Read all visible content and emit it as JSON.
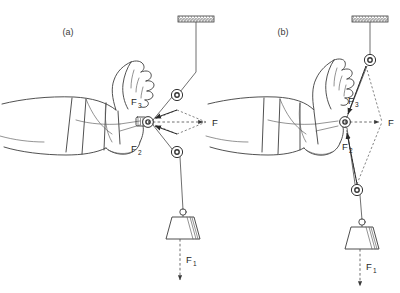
{
  "figure": {
    "background_color": "#ffffff",
    "line_color": "#3a3a3a",
    "width": 400,
    "height": 293
  },
  "panels": [
    {
      "id": "a",
      "label": "(a)",
      "label_x": 68,
      "label_y": 35,
      "description": "Wide-angle traction: pulleys spaced apart, resultant F horizontal",
      "ceiling": {
        "x": 178,
        "y": 16,
        "width": 36,
        "height": 6
      },
      "attachment": {
        "x": 148,
        "y": 122
      },
      "resultant": {
        "label": "F",
        "label_x": 214,
        "label_y": 125,
        "tip_x": 206,
        "tip_y": 122
      },
      "pulleys": [
        {
          "name": "upper-pulley",
          "cx": 177,
          "cy": 95,
          "r": 5.6
        },
        {
          "name": "lower-pulley",
          "cx": 177,
          "cy": 152,
          "r": 5.6
        }
      ],
      "vectors": [
        {
          "label": "F",
          "subscript": "3",
          "label_x": 131,
          "label_y": 104,
          "from_x": 177,
          "from_y": 100,
          "to_x": 152,
          "to_y": 110
        },
        {
          "label": "F",
          "subscript": "2",
          "label_x": 131,
          "label_y": 151,
          "from_x": 177,
          "from_y": 146,
          "to_x": 152,
          "to_y": 136
        }
      ],
      "weight": {
        "cx": 177,
        "cy": 228,
        "top_w": 22,
        "bottom_w": 34,
        "height": 22
      },
      "weight_force": {
        "label": "F",
        "subscript": "1",
        "label_x": 182,
        "label_y": 262,
        "arrow_to_y": 282
      }
    },
    {
      "id": "b",
      "label": "(b)",
      "label_x": 283,
      "label_y": 35,
      "description": "Narrow-angle traction: pulleys near vertical, resultant F horizontal",
      "ceiling": {
        "x": 352,
        "y": 16,
        "width": 36,
        "height": 6
      },
      "attachment": {
        "x": 345,
        "y": 122
      },
      "resultant": {
        "label": "F",
        "label_x": 390,
        "label_y": 125,
        "tip_x": 382,
        "tip_y": 122
      },
      "pulleys": [
        {
          "name": "upper-pulley",
          "cx": 370,
          "cy": 60,
          "r": 5.6
        },
        {
          "name": "lower-pulley",
          "cx": 357,
          "cy": 190,
          "r": 5.6
        }
      ],
      "vectors": [
        {
          "label": "F",
          "subscript": "3",
          "label_x": 350,
          "label_y": 103,
          "from_x": 369,
          "from_y": 66,
          "to_x": 349,
          "to_y": 112
        },
        {
          "label": "F",
          "subscript": "2",
          "label_x": 345,
          "label_y": 148,
          "from_x": 356,
          "from_y": 184,
          "to_x": 347,
          "to_y": 133
        }
      ],
      "weight": {
        "cx": 357,
        "cy": 238,
        "top_w": 22,
        "bottom_w": 34,
        "height": 22
      },
      "weight_force": {
        "label": "F",
        "subscript": "1",
        "label_x": 362,
        "label_y": 266,
        "arrow_to_y": 286
      }
    }
  ],
  "labels": {
    "resultant_force": "F",
    "force_one": "F",
    "force_two": "F",
    "force_three": "F",
    "sub_one": "1",
    "sub_two": "2",
    "sub_three": "3"
  }
}
